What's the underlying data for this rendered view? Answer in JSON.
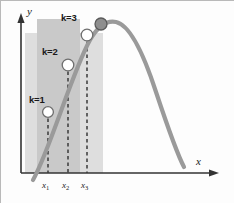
{
  "figure": {
    "title": "",
    "axes": {
      "x_axis_label": "x",
      "y_axis_label": "y"
    },
    "tick_labels": [
      {
        "base": "x",
        "sub": "1"
      },
      {
        "base": "x",
        "sub": "2"
      },
      {
        "base": "x",
        "sub": "3"
      }
    ],
    "point_labels": [
      {
        "text": "k=1"
      },
      {
        "text": "k=2"
      },
      {
        "text": "k=3"
      }
    ]
  },
  "chart_data": {
    "type": "line",
    "title": "",
    "xlabel": "x",
    "ylabel": "y",
    "grid": false,
    "legend": null,
    "axis_style": "arrow",
    "xlim": [
      0,
      234
    ],
    "ylim": [
      0,
      203
    ],
    "series": [
      {
        "name": "unimodal curve",
        "color": "#9a9a9a",
        "width": 4.2,
        "path": "M 33 180 C 50 150, 72 72, 90 40 C 98 26, 106 20, 116 22 C 130 25, 144 55, 156 92 C 166 122, 176 152, 184 167"
      }
    ],
    "markers": [
      {
        "name": "k=1",
        "x": 48,
        "y": 112,
        "r": 5.4,
        "fill": "#ffffff",
        "stroke": "#6e6e6e",
        "label": "k=1",
        "label_x": 29,
        "label_y": 95
      },
      {
        "name": "k=2",
        "x": 68,
        "y": 65,
        "r": 5.8,
        "fill": "#ffffff",
        "stroke": "#6e6e6e",
        "label": "k=2",
        "label_x": 42,
        "label_y": 47
      },
      {
        "name": "k=3",
        "x": 87,
        "y": 35,
        "r": 5.8,
        "fill": "#ffffff",
        "stroke": "#6e6e6e",
        "label": "k=3",
        "label_x": 61,
        "label_y": 13
      },
      {
        "name": "maximum",
        "x": 101,
        "y": 24,
        "r": 6.0,
        "fill": "#8e8e8e",
        "stroke": "#5a5a5a",
        "label": "",
        "label_x": 0,
        "label_y": 0
      }
    ],
    "dashed_lines": [
      {
        "name": "x1-guide",
        "x": 48,
        "y_top": 112,
        "y_bottom": 173
      },
      {
        "name": "x2-guide",
        "x": 68,
        "y_top": 65,
        "y_bottom": 173
      },
      {
        "name": "x3-guide",
        "x": 87,
        "y_top": 35,
        "y_bottom": 173
      }
    ],
    "shaded_bands": [
      {
        "name": "outer-band",
        "x": 25,
        "y": 33,
        "width": 78,
        "height": 140,
        "color": "#dedede"
      },
      {
        "name": "inner-band",
        "x": 37,
        "y": 19,
        "width": 43,
        "height": 154,
        "color": "#c9c9c9"
      }
    ],
    "tick_positions": [
      {
        "label": "x1",
        "x": 48
      },
      {
        "label": "x2",
        "x": 68
      },
      {
        "label": "x3",
        "x": 87
      }
    ],
    "x_axis": {
      "y": 173,
      "x_start": 21,
      "x_end": 218
    },
    "y_axis": {
      "x": 21,
      "y_start": 173,
      "y_end": 14
    }
  }
}
